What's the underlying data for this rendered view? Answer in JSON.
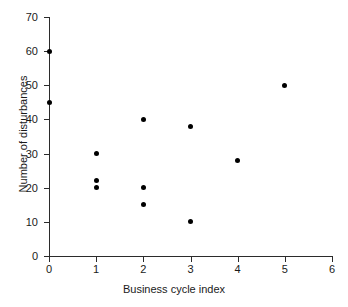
{
  "chart_data": {
    "type": "scatter",
    "title": "",
    "xlabel": "Business cycle index",
    "ylabel": "Number of disturbances",
    "xlim": [
      0,
      6
    ],
    "ylim": [
      0,
      70
    ],
    "xticks": [
      "0",
      "1",
      "2",
      "3",
      "4",
      "5",
      "6"
    ],
    "yticks": [
      "0",
      "10",
      "20",
      "30",
      "40",
      "50",
      "60",
      "70"
    ],
    "xtick_values": [
      0,
      1,
      2,
      3,
      4,
      5,
      6
    ],
    "ytick_values": [
      0,
      10,
      20,
      30,
      40,
      50,
      60,
      70
    ],
    "grid": false,
    "legend": null,
    "marker": "filled-circle",
    "marker_color": "#000000",
    "axis_color": "#2b2b2b",
    "background": "#ffffff",
    "series": [
      {
        "name": "disturbances",
        "points": [
          {
            "x": 0,
            "y": 60
          },
          {
            "x": 0,
            "y": 45
          },
          {
            "x": 1,
            "y": 30
          },
          {
            "x": 1,
            "y": 22
          },
          {
            "x": 1,
            "y": 20
          },
          {
            "x": 2,
            "y": 40
          },
          {
            "x": 2,
            "y": 20
          },
          {
            "x": 2,
            "y": 15
          },
          {
            "x": 3,
            "y": 38
          },
          {
            "x": 3,
            "y": 10
          },
          {
            "x": 4,
            "y": 28
          },
          {
            "x": 5,
            "y": 50
          }
        ]
      }
    ]
  }
}
